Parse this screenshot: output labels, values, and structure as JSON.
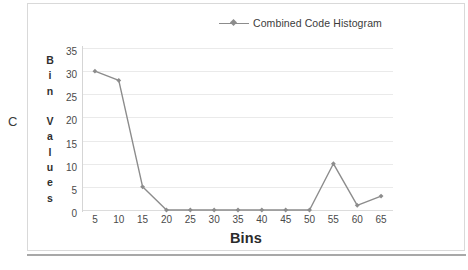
{
  "page": {
    "marker_letter": "C"
  },
  "legend": {
    "position": "top",
    "entries": [
      {
        "label": "Combined Code Histogram",
        "marker": "diamond-marker",
        "color": "#8c8c8c"
      }
    ]
  },
  "axes": {
    "y_title_letters": [
      "B",
      "i",
      "n",
      "",
      "V",
      "a",
      "l",
      "u",
      "e",
      "s"
    ],
    "y_title": "Bin Values",
    "x_title": "Bins"
  },
  "chart_data": {
    "type": "line",
    "title": "",
    "subtitle": "",
    "xlabel": "Bins",
    "ylabel": "Bin Values",
    "x": [
      5,
      10,
      15,
      20,
      25,
      30,
      35,
      40,
      45,
      50,
      55,
      60,
      65
    ],
    "categories": [
      "5",
      "10",
      "15",
      "20",
      "25",
      "30",
      "35",
      "40",
      "45",
      "50",
      "55",
      "60",
      "65"
    ],
    "series": [
      {
        "name": "Combined Code Histogram",
        "color": "#8c8c8c",
        "marker": "diamond",
        "values": [
          30,
          28,
          5,
          0,
          0,
          0,
          0,
          0,
          0,
          0,
          10,
          1,
          3
        ]
      }
    ],
    "values": [
      30,
      28,
      5,
      0,
      0,
      0,
      0,
      0,
      0,
      0,
      10,
      1,
      3
    ],
    "xtick_labels": [
      "5",
      "10",
      "15",
      "20",
      "25",
      "30",
      "35",
      "40",
      "45",
      "50",
      "55",
      "60",
      "65"
    ],
    "ytick_labels": [
      "0",
      "5",
      "10",
      "15",
      "20",
      "25",
      "30",
      "35"
    ],
    "yticks": [
      0,
      5,
      10,
      15,
      20,
      25,
      30,
      35
    ],
    "ylim": [
      0,
      35
    ],
    "grid": "horizontal",
    "legend_position": "top",
    "annotations": []
  },
  "colors": {
    "series": "#8c8c8c",
    "gridline": "#eaeaea",
    "axis": "#d5d5d5",
    "frame": "#d9d9d9",
    "rule": "#a8a8a8",
    "text": "#3b3b3b"
  }
}
